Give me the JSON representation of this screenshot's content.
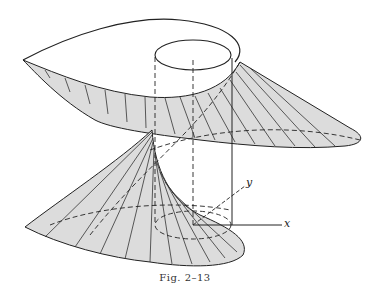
{
  "figure": {
    "caption": "Fig. 2–13",
    "axis_labels": {
      "x": "x",
      "y": "y"
    },
    "colors": {
      "surface_fill": "#d9d9d9",
      "line": "#222222",
      "background": "#ffffff"
    }
  }
}
